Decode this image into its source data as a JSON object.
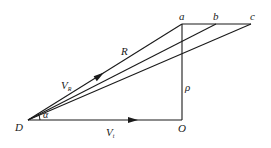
{
  "diagram": {
    "type": "geometry-vector-diagram",
    "background": "#ffffff",
    "stroke_color": "#1a1a1a",
    "points": {
      "D": {
        "label": "D",
        "x": 28,
        "y": 120
      },
      "O": {
        "label": "O",
        "x": 182,
        "y": 120
      },
      "a": {
        "label": "a",
        "x": 182,
        "y": 24
      },
      "b": {
        "label": "b",
        "x": 216,
        "y": 24
      },
      "c": {
        "label": "c",
        "x": 251,
        "y": 24
      }
    },
    "segments": [
      {
        "from": "D",
        "to": "O",
        "arrow_at": [
          133,
          120
        ],
        "label": "V_t"
      },
      {
        "from": "O",
        "to": "a",
        "label": "ρ"
      },
      {
        "from": "a",
        "to": "c"
      },
      {
        "from": "D",
        "to": "a",
        "arrow_at": [
          100,
          75
        ],
        "label": "R"
      },
      {
        "from": "D",
        "to": "b"
      },
      {
        "from": "D",
        "to": "c"
      }
    ],
    "labels": {
      "point_a": "a",
      "point_b": "b",
      "point_c": "c",
      "point_D": "D",
      "point_O": "O",
      "R": "R",
      "rho": "ρ",
      "alpha": "α",
      "V_R_main": "V",
      "V_R_sub": "R",
      "V_t_main": "V",
      "V_t_sub": "t"
    }
  }
}
